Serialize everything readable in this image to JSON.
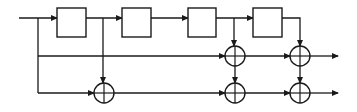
{
  "diagram": {
    "type": "block-diagram",
    "colors": {
      "line": "#1a1a1a",
      "background": "#ffffff"
    },
    "input": {
      "x": 19,
      "y": 18
    },
    "rows": {
      "top": 18,
      "mid": 56,
      "bottom": 93
    },
    "blocks": [
      {
        "id": "delay-1",
        "x": 57,
        "y": 8,
        "w": 29,
        "h": 29,
        "label": ""
      },
      {
        "id": "delay-2",
        "x": 122,
        "y": 8,
        "w": 29,
        "h": 29,
        "label": ""
      },
      {
        "id": "delay-3",
        "x": 188,
        "y": 8,
        "w": 28,
        "h": 29,
        "label": ""
      },
      {
        "id": "delay-4",
        "x": 253,
        "y": 8,
        "w": 29,
        "h": 29,
        "label": ""
      }
    ],
    "adders": [
      {
        "id": "adder-b1",
        "cx": 104,
        "cy": 93,
        "r": 10
      },
      {
        "id": "adder-m3",
        "cx": 235,
        "cy": 56,
        "r": 10
      },
      {
        "id": "adder-b3",
        "cx": 235,
        "cy": 93,
        "r": 10
      },
      {
        "id": "adder-m4",
        "cx": 300,
        "cy": 56,
        "r": 10
      },
      {
        "id": "adder-b4",
        "cx": 300,
        "cy": 93,
        "r": 10
      }
    ],
    "outputs": [
      {
        "id": "output-1",
        "y": 56,
        "x_end": 338
      },
      {
        "id": "output-2",
        "y": 93,
        "x_end": 338
      }
    ]
  }
}
